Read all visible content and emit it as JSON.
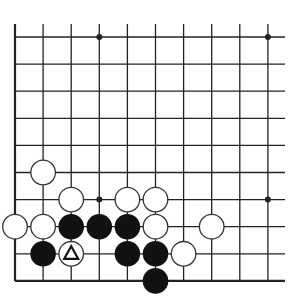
{
  "diagram": {
    "type": "go-board-fragment",
    "columns": 10,
    "rows": 10,
    "grid": {
      "x0": 15,
      "dx": 28.1,
      "y0": 37,
      "dy": 27.1,
      "line_right": 285,
      "line_top": 24,
      "left_edge": true,
      "bottom_edge": true
    },
    "colors": {
      "line": "#222222",
      "black_stone": "#111111",
      "white_stone": "#ffffff",
      "stone_outline": "#333333",
      "background": "#ffffff"
    },
    "star_points": [
      {
        "col": 3,
        "row": 0
      },
      {
        "col": 9,
        "row": 0
      },
      {
        "col": 3,
        "row": 6
      },
      {
        "col": 9,
        "row": 6
      }
    ],
    "stones": [
      {
        "color": "white",
        "col": 1,
        "row": 5
      },
      {
        "color": "white",
        "col": 2,
        "row": 6
      },
      {
        "color": "white",
        "col": 4,
        "row": 6
      },
      {
        "color": "white",
        "col": 5,
        "row": 6
      },
      {
        "color": "white",
        "col": 0,
        "row": 7
      },
      {
        "color": "white",
        "col": 1,
        "row": 7
      },
      {
        "color": "black",
        "col": 2,
        "row": 7
      },
      {
        "color": "black",
        "col": 3,
        "row": 7
      },
      {
        "color": "black",
        "col": 4,
        "row": 7
      },
      {
        "color": "white",
        "col": 5,
        "row": 7
      },
      {
        "color": "white",
        "col": 7,
        "row": 7
      },
      {
        "color": "black",
        "col": 1,
        "row": 8
      },
      {
        "color": "white",
        "col": 2,
        "row": 8,
        "marker": "triangle"
      },
      {
        "color": "black",
        "col": 4,
        "row": 8
      },
      {
        "color": "black",
        "col": 5,
        "row": 8
      },
      {
        "color": "white",
        "col": 6,
        "row": 8
      },
      {
        "color": "black",
        "col": 5,
        "row": 9
      }
    ]
  }
}
